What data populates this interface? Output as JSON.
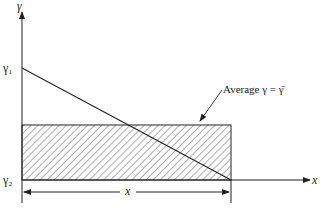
{
  "diagram": {
    "y_axis_label": "γ",
    "x_axis_label": "x",
    "gamma1_label": "γ₁",
    "gamma2_label": "γ₂",
    "dimension_label": "x",
    "annotation": "Average γ = γ̄",
    "colors": {
      "ink": "#222222",
      "background": "#ffffff"
    }
  }
}
